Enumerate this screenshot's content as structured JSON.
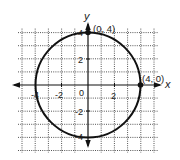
{
  "chart_data": {
    "type": "diagram",
    "title": "",
    "xlabel": "x",
    "ylabel": "y",
    "xlim": [
      -5,
      5
    ],
    "ylim": [
      -5,
      4
    ],
    "grid": true,
    "grid_style": "dotted",
    "x_tick_labels": [
      {
        "value": -4,
        "label": "-4"
      },
      {
        "value": -2,
        "label": "-2"
      },
      {
        "value": 0,
        "label": "0"
      },
      {
        "value": 2,
        "label": "2"
      }
    ],
    "y_tick_labels": [
      {
        "value": 4,
        "label": "4"
      },
      {
        "value": 2,
        "label": "2"
      },
      {
        "value": -2,
        "label": "-2"
      },
      {
        "value": -4,
        "label": "-4"
      }
    ],
    "circle": {
      "center": [
        0,
        0
      ],
      "radius": 4
    },
    "points": [
      {
        "x": 0,
        "y": 4,
        "label": "(0, 4)"
      },
      {
        "x": 4,
        "y": 0,
        "label": "(4, 0)"
      }
    ]
  },
  "labels": {
    "x_axis": "x",
    "y_axis": "y",
    "point_top": "(0, 4)",
    "point_right": "(4, 0)",
    "origin": "0",
    "x_neg4": "-4",
    "x_neg2": "-2",
    "x_pos2": "2",
    "y_pos4": "4",
    "y_pos2": "2",
    "y_neg2": "-2",
    "y_neg4": "-4"
  },
  "colors": {
    "ink": "#111111",
    "grid": "#555555",
    "background": "#ffffff"
  }
}
